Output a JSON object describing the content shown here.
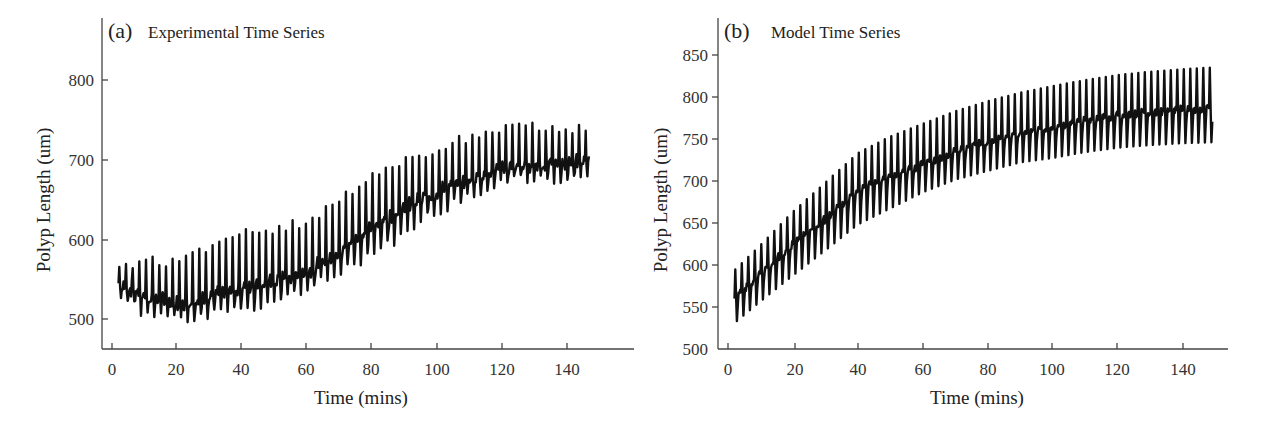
{
  "chart_data": [
    {
      "type": "line",
      "panel": "(a)",
      "title": "Experimental Time Series",
      "xlabel": "Time (mins)",
      "ylabel": "Polyp Length (um)",
      "xlim": [
        -2,
        154
      ],
      "ylim": [
        455,
        860
      ],
      "xticks": [
        0,
        20,
        40,
        60,
        80,
        100,
        120,
        140
      ],
      "yticks": [
        500,
        600,
        700,
        800
      ],
      "grid": false,
      "legend": null,
      "period_mins": 2.05,
      "t_range": [
        2,
        147
      ],
      "series": [
        {
          "name": "Experimental",
          "baseline": {
            "x": [
              2,
              10,
              20,
              30,
              40,
              50,
              60,
              70,
              80,
              90,
              100,
              110,
              120,
              130,
              140,
              147
            ],
            "y": [
              545,
              530,
              520,
              528,
              540,
              548,
              560,
              585,
              615,
              640,
              660,
              675,
              690,
              695,
              695,
              700
            ]
          },
          "peaks": {
            "x": [
              2,
              10,
              20,
              30,
              40,
              50,
              60,
              70,
              80,
              90,
              100,
              110,
              120,
              130,
              140,
              147
            ],
            "y": [
              565,
              575,
              570,
              595,
              610,
              615,
              625,
              655,
              680,
              705,
              715,
              730,
              740,
              742,
              740,
              740
            ]
          },
          "troughs": {
            "x": [
              2,
              10,
              20,
              30,
              40,
              50,
              60,
              70,
              80,
              90,
              100,
              110,
              120,
              130,
              140,
              147
            ],
            "y": [
              530,
              500,
              495,
              500,
              510,
              515,
              530,
              555,
              575,
              600,
              630,
              650,
              670,
              675,
              670,
              680
            ]
          }
        }
      ]
    },
    {
      "type": "line",
      "panel": "(b)",
      "title": "Model Time Series",
      "xlabel": "Time (mins)",
      "ylabel": "Polyp Length (um)",
      "xlim": [
        -2,
        152
      ],
      "ylim": [
        500,
        890
      ],
      "xticks": [
        0,
        20,
        40,
        60,
        80,
        100,
        120,
        140
      ],
      "yticks": [
        500,
        550,
        600,
        650,
        700,
        750,
        800,
        850
      ],
      "grid": false,
      "legend": null,
      "period_mins": 2.0,
      "t_range": [
        2,
        149
      ],
      "series": [
        {
          "name": "Model",
          "baseline": {
            "x": [
              2,
              10,
              20,
              30,
              40,
              50,
              60,
              70,
              80,
              90,
              100,
              110,
              120,
              130,
              140,
              149
            ],
            "y": [
              560,
              590,
              625,
              655,
              690,
              705,
              720,
              735,
              748,
              758,
              765,
              772,
              778,
              782,
              785,
              787
            ]
          },
          "peaks": {
            "x": [
              2,
              10,
              20,
              30,
              40,
              50,
              60,
              70,
              80,
              90,
              100,
              110,
              120,
              130,
              140,
              149
            ],
            "y": [
              595,
              625,
              665,
              700,
              735,
              755,
              770,
              785,
              797,
              807,
              815,
              822,
              828,
              832,
              835,
              837
            ]
          },
          "troughs": {
            "x": [
              2,
              10,
              20,
              30,
              40,
              50,
              60,
              70,
              80,
              90,
              100,
              110,
              120,
              130,
              140,
              149
            ],
            "y": [
              525,
              550,
              580,
              610,
              640,
              660,
              680,
              695,
              705,
              715,
              720,
              727,
              732,
              735,
              737,
              738
            ]
          }
        }
      ]
    }
  ],
  "panels": {
    "a": {
      "letter": "(a)",
      "title": "Experimental Time Series",
      "xlabel": "Time (mins)",
      "ylabel": "Polyp Length (um)",
      "xtick_labels": [
        "0",
        "20",
        "40",
        "60",
        "80",
        "100",
        "120",
        "140"
      ],
      "ytick_labels": [
        "800",
        "700",
        "600",
        "500"
      ]
    },
    "b": {
      "letter": "(b)",
      "title": "Model Time Series",
      "xlabel": "Time (mins)",
      "ylabel": "Polyp Length (um)",
      "xtick_labels": [
        "0",
        "20",
        "40",
        "60",
        "80",
        "100",
        "120",
        "140"
      ],
      "ytick_labels": [
        "850",
        "800",
        "750",
        "700",
        "650",
        "600",
        "550",
        "500"
      ]
    }
  },
  "colors": {
    "series": "#111111",
    "axis": "#444444",
    "text": "#222222",
    "background": "#ffffff"
  }
}
